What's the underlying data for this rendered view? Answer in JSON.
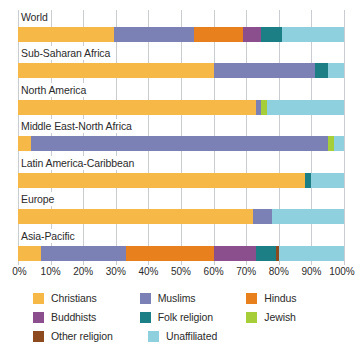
{
  "chart_data": {
    "type": "bar",
    "orientation": "horizontal",
    "stacked": true,
    "title": "",
    "xlabel": "",
    "ylabel": "",
    "xlim": [
      0,
      100
    ],
    "grid": true,
    "legend_position": "bottom",
    "xticks": [
      "0%",
      "10%",
      "20%",
      "30%",
      "40%",
      "50%",
      "60%",
      "70%",
      "80%",
      "90%",
      "100%"
    ],
    "xtick_values": [
      0,
      10,
      20,
      30,
      40,
      50,
      60,
      70,
      80,
      90,
      100
    ],
    "categories": [
      "World",
      "Sub-Saharan Africa",
      "North America",
      "Middle East-North Africa",
      "Latin America-Caribbean",
      "Europe",
      "Asia-Pacific"
    ],
    "series": [
      {
        "name": "Christians",
        "color": "#f6b948",
        "values": [
          29.5,
          60.0,
          73.0,
          4.0,
          88.0,
          72.0,
          7.0
        ]
      },
      {
        "name": "Muslims",
        "color": "#7b81b5",
        "values": [
          24.5,
          31.0,
          1.5,
          91.0,
          0.0,
          6.0,
          26.0
        ]
      },
      {
        "name": "Hindus",
        "color": "#e8801d",
        "values": [
          15.0,
          0.0,
          0.0,
          0.0,
          0.0,
          0.0,
          27.0
        ]
      },
      {
        "name": "Buddhists",
        "color": "#8c4f8e",
        "values": [
          5.5,
          0.0,
          0.0,
          0.0,
          0.0,
          0.0,
          13.0
        ]
      },
      {
        "name": "Folk religion",
        "color": "#1d7f86",
        "values": [
          6.5,
          4.0,
          0.0,
          0.0,
          2.0,
          0.0,
          6.0
        ]
      },
      {
        "name": "Jewish",
        "color": "#a6ce39",
        "values": [
          0.0,
          0.0,
          2.0,
          2.0,
          0.0,
          0.0,
          0.0
        ]
      },
      {
        "name": "Other religion",
        "color": "#8c4a1e",
        "values": [
          0.0,
          0.0,
          0.0,
          0.0,
          0.0,
          0.0,
          1.0
        ]
      },
      {
        "name": "Unaffiliated",
        "color": "#8fd0de",
        "values": [
          19.0,
          5.0,
          23.5,
          3.0,
          10.0,
          22.0,
          20.0
        ]
      }
    ],
    "legend": [
      {
        "label": "Christians",
        "color": "#f6b948"
      },
      {
        "label": "Muslims",
        "color": "#7b81b5"
      },
      {
        "label": "Hindus",
        "color": "#e8801d"
      },
      {
        "label": "Buddhists",
        "color": "#8c4f8e"
      },
      {
        "label": "Folk religion",
        "color": "#1d7f86"
      },
      {
        "label": "Jewish",
        "color": "#a6ce39"
      },
      {
        "label": "Other religion",
        "color": "#8c4a1e"
      },
      {
        "label": "Unaffiliated",
        "color": "#8fd0de"
      }
    ],
    "colors": {
      "grid": "#c9ccd1",
      "text": "#2b2b2b",
      "background": "#ffffff"
    }
  }
}
